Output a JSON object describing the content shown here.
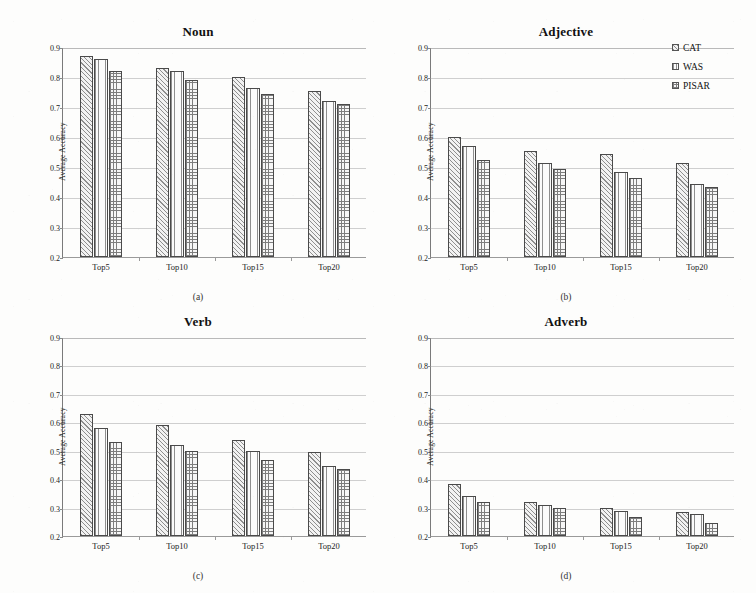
{
  "figure": {
    "background": "#fdfdfc",
    "ylabel": "Average Accuracy",
    "axis": {
      "yticks": [
        "0.9",
        "0.8",
        "0.7",
        "0.6",
        "0.5",
        "0.4",
        "0.3",
        "0.2"
      ],
      "ymin": 0.2,
      "ymax": 0.9,
      "ystep": 0.1
    },
    "xticks": [
      "Top5",
      "Top10",
      "Top15",
      "Top20"
    ]
  },
  "legend": {
    "position": "top-right",
    "entries": [
      {
        "label": "CAT",
        "pattern": "diagonal-hatch",
        "icon": "legend-swatch-icon"
      },
      {
        "label": "WAS",
        "pattern": "vertical-lines",
        "icon": "legend-swatch-icon"
      },
      {
        "label": "PISAR",
        "pattern": "cross-hatch",
        "icon": "legend-swatch-icon"
      }
    ]
  },
  "chart_data": [
    {
      "type": "bar",
      "title": "Noun",
      "caption": "(a)",
      "xlabel": "",
      "ylabel": "Average Accuracy",
      "categories": [
        "Top5",
        "Top10",
        "Top15",
        "Top20"
      ],
      "ylim": [
        0.2,
        0.9
      ],
      "grid": true,
      "series": [
        {
          "name": "CAT",
          "values": [
            0.87,
            0.83,
            0.8,
            0.755
          ]
        },
        {
          "name": "WAS",
          "values": [
            0.86,
            0.82,
            0.765,
            0.72
          ]
        },
        {
          "name": "PISAR",
          "values": [
            0.82,
            0.79,
            0.745,
            0.71
          ]
        }
      ]
    },
    {
      "type": "bar",
      "title": "Adjective",
      "caption": "(b)",
      "xlabel": "",
      "ylabel": "Average Accuracy",
      "categories": [
        "Top5",
        "Top10",
        "Top15",
        "Top20"
      ],
      "ylim": [
        0.2,
        0.9
      ],
      "grid": true,
      "series": [
        {
          "name": "CAT",
          "values": [
            0.6,
            0.555,
            0.545,
            0.515
          ]
        },
        {
          "name": "WAS",
          "values": [
            0.57,
            0.515,
            0.485,
            0.445
          ]
        },
        {
          "name": "PISAR",
          "values": [
            0.525,
            0.495,
            0.465,
            0.435
          ]
        }
      ]
    },
    {
      "type": "bar",
      "title": "Verb",
      "caption": "(c)",
      "xlabel": "",
      "ylabel": "Average Accuracy",
      "categories": [
        "Top5",
        "Top10",
        "Top15",
        "Top20"
      ],
      "ylim": [
        0.2,
        0.9
      ],
      "grid": true,
      "series": [
        {
          "name": "CAT",
          "values": [
            0.63,
            0.59,
            0.538,
            0.495
          ]
        },
        {
          "name": "WAS",
          "values": [
            0.58,
            0.52,
            0.498,
            0.445
          ]
        },
        {
          "name": "PISAR",
          "values": [
            0.53,
            0.498,
            0.468,
            0.435
          ]
        }
      ]
    },
    {
      "type": "bar",
      "title": "Adverb",
      "caption": "(d)",
      "xlabel": "",
      "ylabel": "Average Accuracy",
      "categories": [
        "Top5",
        "Top10",
        "Top15",
        "Top20"
      ],
      "ylim": [
        0.2,
        0.9
      ],
      "grid": true,
      "series": [
        {
          "name": "CAT",
          "values": [
            0.382,
            0.318,
            0.298,
            0.285
          ]
        },
        {
          "name": "WAS",
          "values": [
            0.342,
            0.31,
            0.288,
            0.278
          ]
        },
        {
          "name": "PISAR",
          "values": [
            0.32,
            0.298,
            0.268,
            0.245
          ]
        }
      ]
    }
  ],
  "panel_geometry": [
    {
      "left": 18,
      "top": 24,
      "width": 360,
      "height": 290
    },
    {
      "left": 386,
      "top": 24,
      "width": 360,
      "height": 290
    },
    {
      "left": 18,
      "top": 314,
      "width": 360,
      "height": 279
    },
    {
      "left": 386,
      "top": 314,
      "width": 360,
      "height": 279
    }
  ]
}
